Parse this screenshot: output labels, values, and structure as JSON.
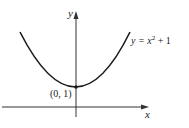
{
  "diagram": {
    "equation_label": "y = x",
    "equation_exponent": "2",
    "equation_suffix": " + 1",
    "vertex_label": "(0, 1)",
    "x_axis_label": "x",
    "y_axis_label": "y",
    "curve_color": "#1a1a1a",
    "axis_color": "#333333"
  }
}
